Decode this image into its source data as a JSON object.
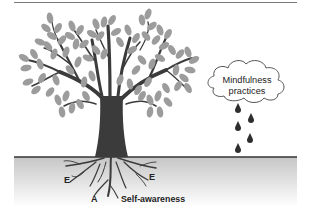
{
  "diagram": {
    "type": "illustration",
    "cloud": {
      "label_line1": "Mindfulness",
      "label_line2": "practices",
      "raindrop_count": 5
    },
    "roots": {
      "labels": [
        {
          "text": "E",
          "position": "left"
        },
        {
          "text": "E",
          "position": "right"
        },
        {
          "text": "A",
          "position": "bottom-left"
        },
        {
          "text": "Self-awareness",
          "position": "bottom-right"
        }
      ]
    },
    "colors": {
      "trunk": "#3b3b3b",
      "leaves": "#9c9c9c",
      "ground_line": "#333333",
      "ground_gradient_top": "#c8c8c8",
      "ground_gradient_bottom": "#ffffff",
      "raindrop": "#2e2e2e",
      "cloud_stroke": "#555555"
    }
  }
}
